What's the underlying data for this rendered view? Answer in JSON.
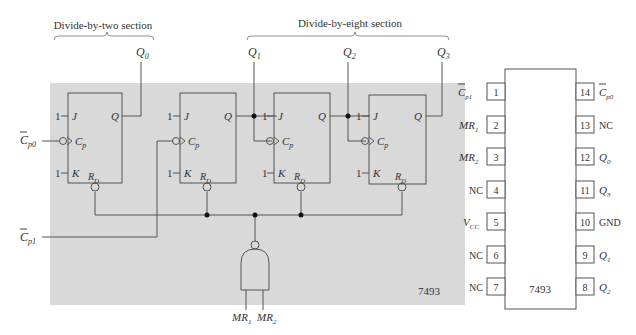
{
  "diagram": {
    "sections": {
      "divide_by_two": "Divide-by-two section",
      "divide_by_eight": "Divide-by-eight section"
    },
    "outputs": [
      "Q",
      "Q",
      "Q",
      "Q"
    ],
    "output_subs": [
      "0",
      "1",
      "2",
      "3"
    ],
    "inputs": {
      "cp0": {
        "main": "C",
        "sub": "p0"
      },
      "cp1": {
        "main": "C",
        "sub": "p1"
      },
      "mr1": {
        "main": "MR",
        "sub": "1"
      },
      "mr2": {
        "main": "MR",
        "sub": "2"
      }
    },
    "flipflop": {
      "j_label": "J",
      "k_label": "K",
      "q_label": "Q",
      "cp_main": "C",
      "cp_sub": "p",
      "rd_main": "R",
      "rd_sub": "D",
      "one": "1"
    },
    "part_number": "7493",
    "colors": {
      "shade": "#d9d9d9",
      "line": "#555555"
    }
  },
  "pinout": {
    "chip_label": "7493",
    "left_pins": [
      {
        "num": "1",
        "label": "C",
        "sub": "p1",
        "bar": true
      },
      {
        "num": "2",
        "label": "MR",
        "sub": "1",
        "bar": false
      },
      {
        "num": "3",
        "label": "MR",
        "sub": "2",
        "bar": false
      },
      {
        "num": "4",
        "label": "NC",
        "sub": "",
        "bar": false
      },
      {
        "num": "5",
        "label": "V",
        "sub": "CC",
        "bar": false
      },
      {
        "num": "6",
        "label": "NC",
        "sub": "",
        "bar": false
      },
      {
        "num": "7",
        "label": "NC",
        "sub": "",
        "bar": false
      }
    ],
    "right_pins": [
      {
        "num": "14",
        "label": "C",
        "sub": "p0",
        "bar": true
      },
      {
        "num": "13",
        "label": "NC",
        "sub": "",
        "bar": false
      },
      {
        "num": "12",
        "label": "Q",
        "sub": "0",
        "bar": false
      },
      {
        "num": "11",
        "label": "Q",
        "sub": "3",
        "bar": false
      },
      {
        "num": "10",
        "label": "GND",
        "sub": "",
        "bar": false
      },
      {
        "num": "9",
        "label": "Q",
        "sub": "1",
        "bar": false
      },
      {
        "num": "8",
        "label": "Q",
        "sub": "2",
        "bar": false
      }
    ]
  }
}
